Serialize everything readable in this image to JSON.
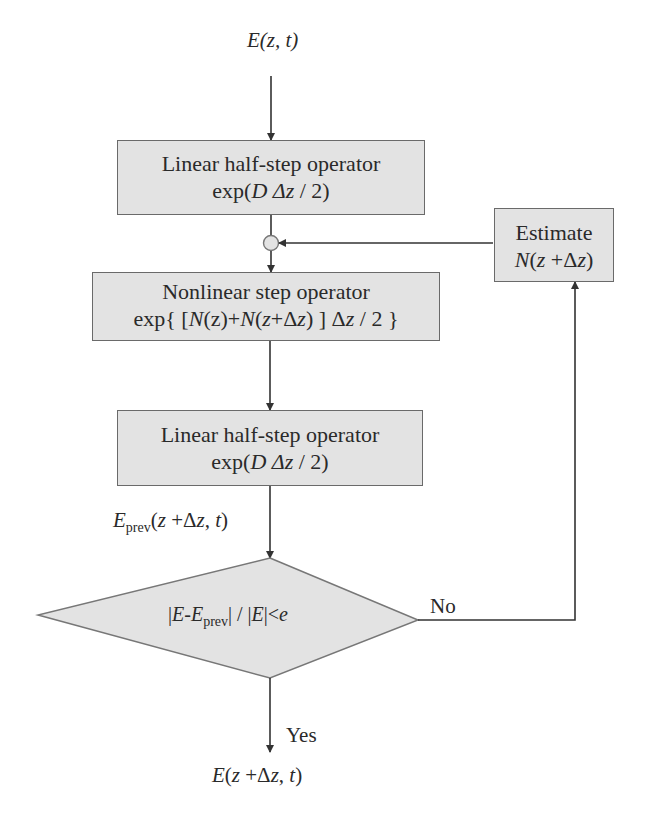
{
  "diagram": {
    "type": "flowchart",
    "title_input": {
      "E": "E",
      "args": "(z, t)"
    },
    "nodes": {
      "linear1": {
        "line1": "Linear half-step operator",
        "exp_prefix": "exp(",
        "D": "D",
        "dz": " Δz",
        "suffix": " / 2)"
      },
      "nonlinear": {
        "line1": "Nonlinear step operator",
        "line2_a": "exp{ [",
        "N1": "N",
        "line2_b": "(z)+",
        "N2": "N",
        "line2_c": "(",
        "z": "z",
        "line2_d": "+Δ",
        "z2": "z",
        "line2_e": ") ] Δ",
        "z3": "z",
        "line2_f": " / 2 }"
      },
      "linear2": {
        "line1": "Linear half-step operator",
        "exp_prefix": "exp(",
        "D": "D",
        "dz": " Δz",
        "suffix": " / 2)"
      },
      "estimate": {
        "line1": "Estimate",
        "N": "N",
        "args_a": "(",
        "z": "z",
        "args_b": " +Δ",
        "z2": "z",
        "args_c": ")"
      },
      "decision": {
        "a": "|",
        "E": "E",
        "b": "-",
        "E2": "E",
        "sub": "prev",
        "c": "| / |",
        "E3": "E",
        "d": "|<",
        "e": "e"
      }
    },
    "labels": {
      "e_prev": {
        "E": "E",
        "sub": "prev",
        "a": "(",
        "z": "z",
        "b": " +Δ",
        "z2": "z",
        "c": ", ",
        "t": "t",
        "d": ")"
      },
      "no": "No",
      "yes": "Yes",
      "output": {
        "E": "E",
        "a": "(",
        "z": "z",
        "b": " +Δ",
        "z2": "z",
        "c": ", ",
        "t": "t",
        "d": ")"
      }
    },
    "colors": {
      "box_fill": "#e3e3e3",
      "box_border": "#6a6a6a",
      "line": "#333333",
      "background": "#ffffff"
    }
  }
}
